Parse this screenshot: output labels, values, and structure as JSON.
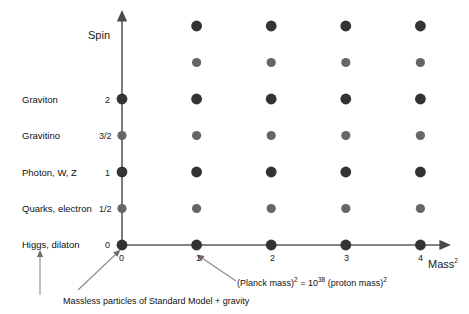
{
  "chart_data": {
    "type": "scatter",
    "title": "",
    "xlabel": "Mass²",
    "ylabel": "Spin",
    "xlabel_base": "Mass",
    "xlabel_exp": "2",
    "grid": false,
    "legend": null,
    "xlim": [
      0,
      4.5
    ],
    "ylim": [
      0,
      3.2
    ],
    "x_ticks": [
      "0",
      "1",
      "2",
      "3",
      "4"
    ],
    "x_tick_values": [
      0,
      1,
      2,
      3,
      4
    ],
    "y_ticks": [
      "0",
      "1/2",
      "1",
      "3/2",
      "2"
    ],
    "y_tick_values": [
      0,
      0.5,
      1,
      1.5,
      2
    ],
    "row_spins": [
      0,
      0.5,
      1,
      1.5,
      2,
      2.5,
      3
    ],
    "series": [
      {
        "name": "integer-spin states",
        "marker": "large-dark-dot",
        "color": "#333333",
        "points": [
          {
            "x": 0,
            "y": 0
          },
          {
            "x": 0,
            "y": 1
          },
          {
            "x": 0,
            "y": 2
          },
          {
            "x": 1,
            "y": 0
          },
          {
            "x": 1,
            "y": 1
          },
          {
            "x": 1,
            "y": 2
          },
          {
            "x": 1,
            "y": 3
          },
          {
            "x": 2,
            "y": 0
          },
          {
            "x": 2,
            "y": 1
          },
          {
            "x": 2,
            "y": 2
          },
          {
            "x": 2,
            "y": 3
          },
          {
            "x": 3,
            "y": 0
          },
          {
            "x": 3,
            "y": 1
          },
          {
            "x": 3,
            "y": 2
          },
          {
            "x": 3,
            "y": 3
          },
          {
            "x": 4,
            "y": 0
          },
          {
            "x": 4,
            "y": 1
          },
          {
            "x": 4,
            "y": 2
          },
          {
            "x": 4,
            "y": 3
          }
        ]
      },
      {
        "name": "half-integer-spin states",
        "marker": "small-gray-dot",
        "color": "#666666",
        "points": [
          {
            "x": 0,
            "y": 0.5
          },
          {
            "x": 0,
            "y": 1.5
          },
          {
            "x": 1,
            "y": 0.5
          },
          {
            "x": 1,
            "y": 1.5
          },
          {
            "x": 1,
            "y": 2.5
          },
          {
            "x": 2,
            "y": 0.5
          },
          {
            "x": 2,
            "y": 1.5
          },
          {
            "x": 2,
            "y": 2.5
          },
          {
            "x": 3,
            "y": 0.5
          },
          {
            "x": 3,
            "y": 1.5
          },
          {
            "x": 3,
            "y": 2.5
          },
          {
            "x": 4,
            "y": 0.5
          },
          {
            "x": 4,
            "y": 1.5
          },
          {
            "x": 4,
            "y": 2.5
          }
        ]
      }
    ],
    "row_labels": [
      {
        "spin": 2,
        "label": "Graviton",
        "tick": "2"
      },
      {
        "spin": 1.5,
        "label": "Gravitino",
        "tick": "3/2"
      },
      {
        "spin": 1,
        "label": "Photon, W, Z",
        "tick": "1"
      },
      {
        "spin": 0.5,
        "label": "Quarks, electron",
        "tick": "1/2"
      },
      {
        "spin": 0,
        "label": "Higgs, dilaton",
        "tick": "0"
      }
    ],
    "annotations": [
      {
        "name": "massless-particles-note",
        "text": "Massless particles of Standard Model + gravity",
        "points_to": [
          "Higgs, dilaton",
          "origin"
        ]
      },
      {
        "name": "planck-mass-note",
        "text_parts": {
          "p1": "(Planck mass)",
          "e1": "2",
          "p2": " = 10",
          "e2": "38",
          "p3": " (proton mass)",
          "e3": "2"
        },
        "text": "(Planck mass)² = 10³⁸ (proton mass)²",
        "points_to": "mass-squared = 1"
      }
    ]
  },
  "axes": {
    "y_title": "Spin",
    "x_title_base": "Mass",
    "x_title_exp": "2"
  },
  "y_tick_labels": {
    "t0": "0",
    "t1": "1/2",
    "t2": "1",
    "t3": "3/2",
    "t4": "2"
  },
  "x_tick_labels": {
    "t0": "0",
    "t1": "1",
    "t2": "2",
    "t3": "3",
    "t4": "4"
  },
  "row_labels": {
    "r0": "Graviton",
    "r1": "Gravitino",
    "r2": "Photon, W, Z",
    "r3": "Quarks, electron",
    "r4": "Higgs, dilaton"
  },
  "annotations": {
    "massless_note": "Massless particles of Standard Model + gravity",
    "planck": {
      "p1": "(Planck mass)",
      "e1": "2",
      "p2": " = 10",
      "e2": "38",
      "p3": " (proton mass)",
      "e3": "2"
    }
  },
  "colors": {
    "dot_integer": "#333333",
    "dot_half": "#666666",
    "axis": "#555555",
    "text": "#1a1a1a",
    "pointer": "#777777",
    "background": "#ffffff"
  }
}
